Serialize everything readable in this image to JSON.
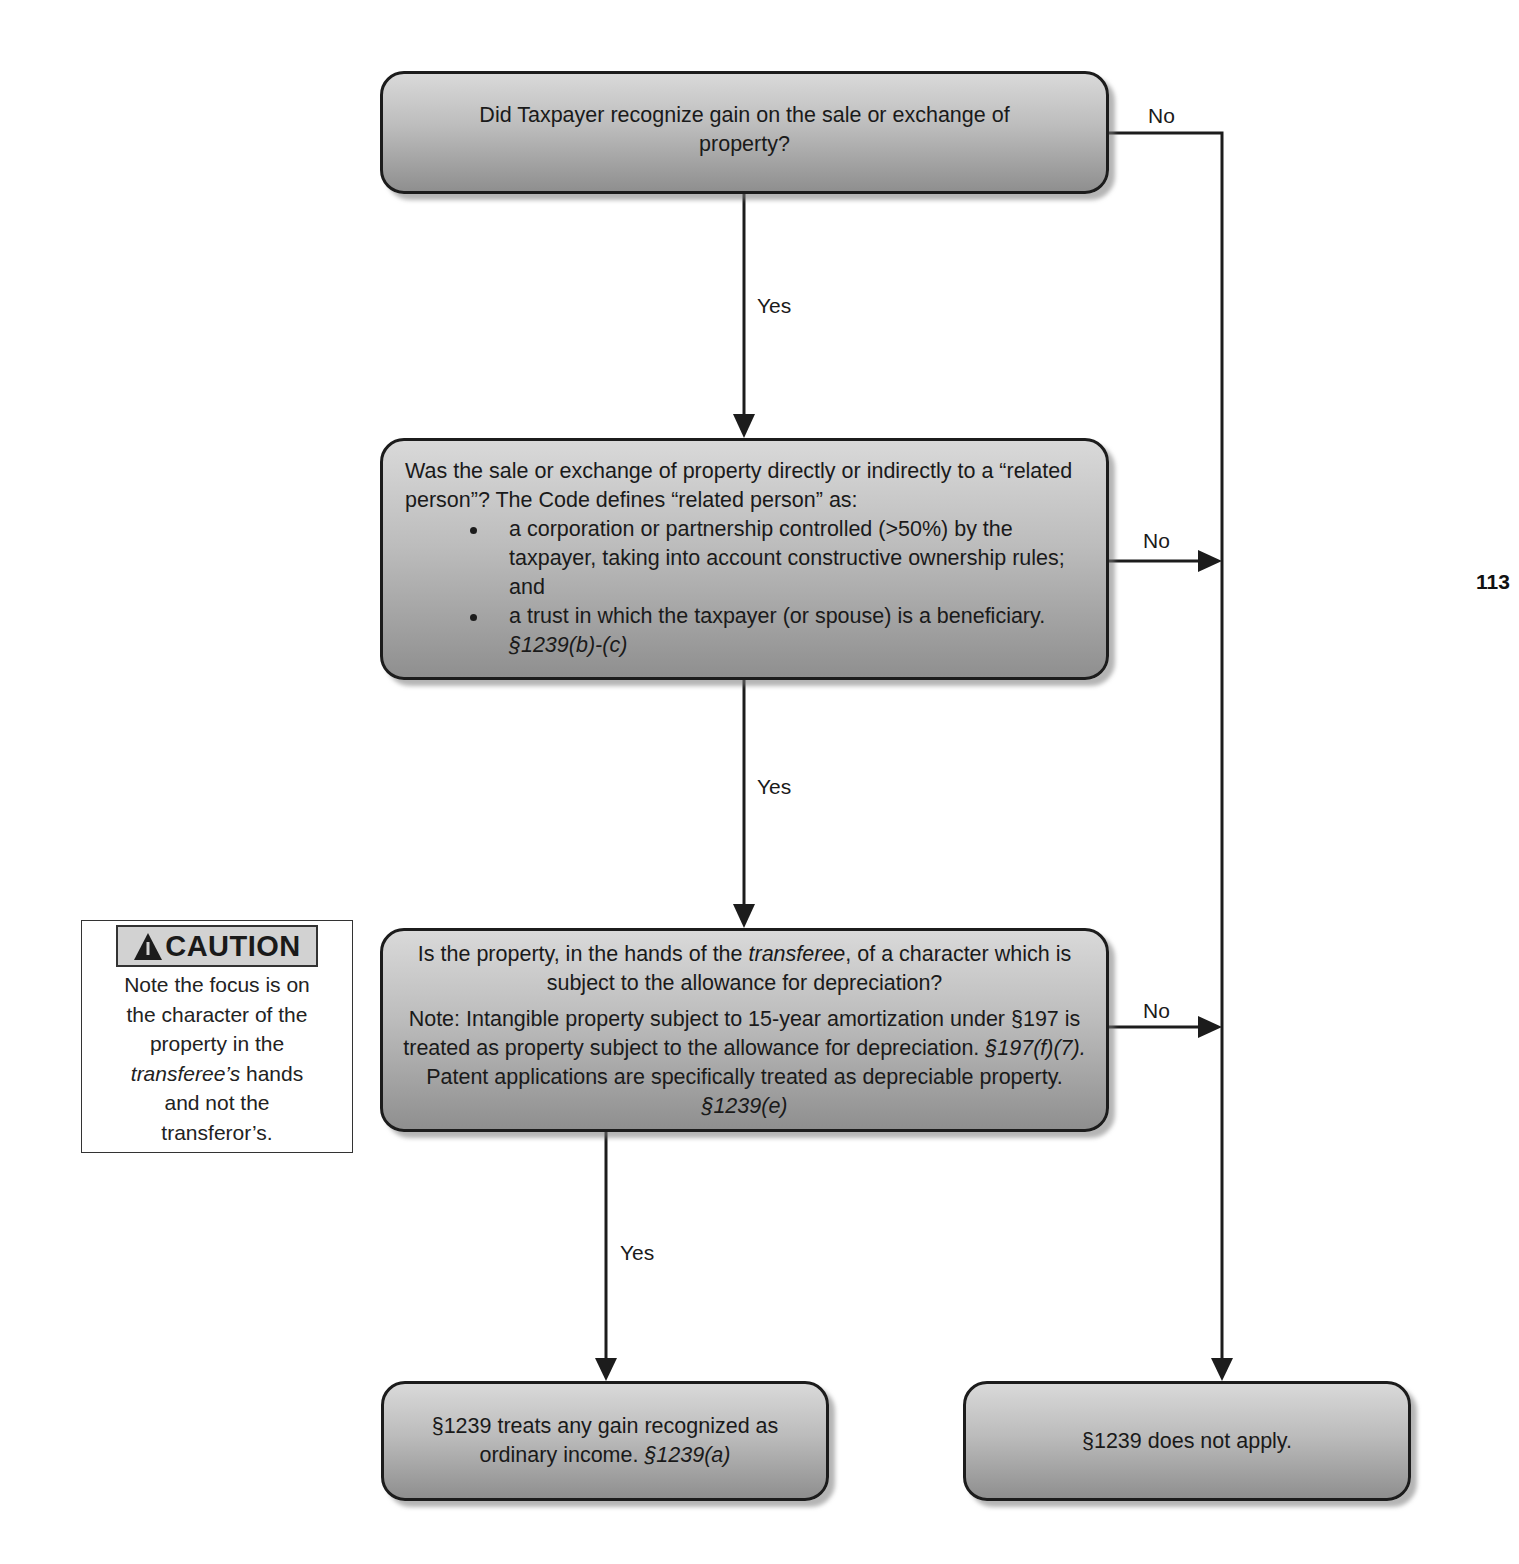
{
  "page_number": "113",
  "nodes": {
    "q1": {
      "text": "Did Taxpayer recognize gain on the sale or exchange of property?"
    },
    "q2": {
      "intro": "Was the sale or exchange of property directly or indirectly to a “related person”?  The Code defines “related person” as:",
      "bullets": [
        {
          "text": "a corporation or partnership controlled (>50%) by the taxpayer, taking into account constructive ownership rules; and"
        },
        {
          "text": "a trust in which the taxpayer (or spouse) is a beneficiary.  ",
          "cite": "§1239(b)-(c)"
        }
      ]
    },
    "q3": {
      "q_pre": "Is the property, in the hands of the ",
      "q_italic": "transferee",
      "q_post": ", of a character which is subject to the allowance for depreciation?",
      "note_pre": "Note:  Intangible property subject to 15-year amortization under §197 is treated as property subject to the allowance for depreciation. ",
      "note_cite1": "§197(f)(7).",
      "note_mid": "  Patent applications are specifically treated as depreciable property.  ",
      "note_cite2": "§1239(e)"
    },
    "result_yes": {
      "text": "§1239 treats any gain recognized as ordinary income.  ",
      "cite": "§1239(a)"
    },
    "result_no": {
      "text": "§1239 does not apply."
    }
  },
  "edges": [
    {
      "from": "q1",
      "to": "q2",
      "label": "Yes"
    },
    {
      "from": "q1",
      "to": "result_no",
      "label": "No"
    },
    {
      "from": "q2",
      "to": "q3",
      "label": "Yes"
    },
    {
      "from": "q2",
      "to": "result_no",
      "label": "No"
    },
    {
      "from": "q3",
      "to": "result_yes",
      "label": "Yes"
    },
    {
      "from": "q3",
      "to": "result_no",
      "label": "No"
    }
  ],
  "caution": {
    "icon": "warning-triangle-icon",
    "title": "CAUTION",
    "line1": "Note the focus is on",
    "line2": "the character of the",
    "line3": "property in the",
    "line4_italic": "transferee’s",
    "line4_rest": " hands",
    "line5": "and not the",
    "line6": "transferor’s."
  },
  "colors": {
    "box_top": "#d9d9d9",
    "box_bottom": "#8f8f8f",
    "line": "#1c1c1c",
    "caution_header_bg": "#d2d2d2"
  }
}
